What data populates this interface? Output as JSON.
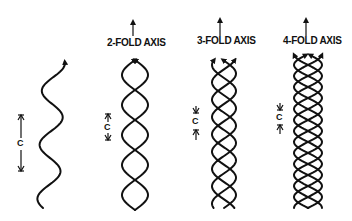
{
  "diagram": {
    "panels": [
      {
        "id": "single",
        "title": "",
        "strands": 1,
        "pitch_label": "C"
      },
      {
        "id": "two-fold",
        "title": "2-FOLD AXIS",
        "strands": 2,
        "pitch_label": "C"
      },
      {
        "id": "three-fold",
        "title": "3-FOLD AXIS",
        "strands": 3,
        "pitch_label": "C"
      },
      {
        "id": "four-fold",
        "title": "4-FOLD AXIS",
        "strands": 4,
        "pitch_label": "C"
      }
    ],
    "colors": {
      "ink": "#111111",
      "background": "#ffffff"
    }
  }
}
